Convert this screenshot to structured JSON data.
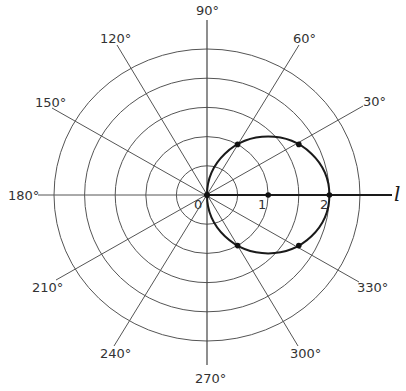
{
  "figure": {
    "type": "polar-diagram",
    "center": {
      "x": 207,
      "y": 195
    },
    "ring_count": 5,
    "ring_step_px": {
      "x": 30.6,
      "y": 29.2
    },
    "colors": {
      "grid": "#555555",
      "curve": "#1a1a1a",
      "text": "#333333"
    },
    "angle_labels": [
      {
        "deg": 0,
        "text": ""
      },
      {
        "deg": 30,
        "text": "30°"
      },
      {
        "deg": 60,
        "text": "60°"
      },
      {
        "deg": 90,
        "text": "90°"
      },
      {
        "deg": 120,
        "text": "120°"
      },
      {
        "deg": 150,
        "text": "150°"
      },
      {
        "deg": 180,
        "text": "180°"
      },
      {
        "deg": 210,
        "text": "210°"
      },
      {
        "deg": 240,
        "text": "240°"
      },
      {
        "deg": 270,
        "text": "270°"
      },
      {
        "deg": 300,
        "text": "300°"
      },
      {
        "deg": 330,
        "text": "330°"
      }
    ],
    "radial_ticks": [
      {
        "value": 0,
        "text": "0"
      },
      {
        "value": 1,
        "text": "1"
      },
      {
        "value": 2,
        "text": "2"
      }
    ],
    "polar_axis_label": "l",
    "curve": {
      "equation": "r = 2 cos θ",
      "points": [
        {
          "theta": 0,
          "r": 2
        },
        {
          "theta": 30,
          "r": 1.732
        },
        {
          "theta": 60,
          "r": 1
        },
        {
          "theta": 90,
          "r": 0
        },
        {
          "theta": 300,
          "r": 1
        },
        {
          "theta": 330,
          "r": 1.732
        }
      ],
      "axis_points": [
        {
          "r": 1
        }
      ]
    }
  },
  "labels": {
    "a30": "30°",
    "a60": "60°",
    "a90": "90°",
    "a120": "120°",
    "a150": "150°",
    "a180": "180°",
    "a210": "210°",
    "a240": "240°",
    "a270": "270°",
    "a300": "300°",
    "a330": "330°",
    "r0": "0",
    "r1": "1",
    "r2": "2",
    "axis": "l"
  }
}
